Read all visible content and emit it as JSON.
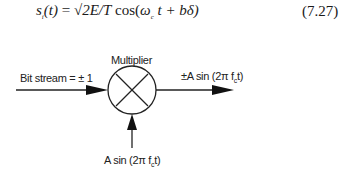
{
  "equation": {
    "lhs": "s",
    "lhs_sub": "i",
    "lhs_arg": "(t)",
    "equals": " = ",
    "sqrt_content": "2E/T",
    "func": " cos(",
    "omega": "ω",
    "omega_sub": "c",
    "rest": " t + bδ)",
    "number": "(7.27)"
  },
  "diagram": {
    "multiplier_label": "Multiplier",
    "input_label": "Bit stream = ± 1",
    "output_label_prefix": "±A sin (2π f",
    "output_label_sub": "c",
    "output_label_suffix": "t)",
    "carrier_label_prefix": "A sin (2π f",
    "carrier_label_sub": "c",
    "carrier_label_suffix": "t)",
    "multiplier_symbol": "×"
  }
}
